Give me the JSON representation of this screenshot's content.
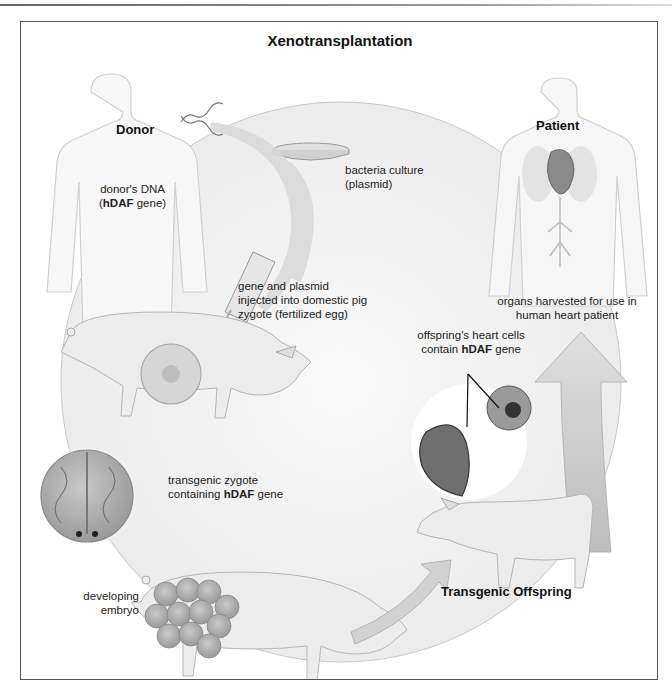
{
  "diagram": {
    "title": "Xenotransplantation",
    "headings": {
      "donor": "Donor",
      "patient": "Patient",
      "offspring": "Transgenic Offspring"
    },
    "labels": {
      "donor_dna": {
        "line1": "donor's DNA",
        "line2_open": "(",
        "line2_bold": "hDAF",
        "line2_rest": " gene)"
      },
      "bacteria": {
        "line1": "bacteria culture",
        "line2": "(plasmid)"
      },
      "injection": {
        "line1": "gene and plasmid",
        "line2": "injected into domestic pig",
        "line3": "zygote (fertilized egg)"
      },
      "zygote": {
        "line1": "transgenic zygote",
        "line2_pre": "containing ",
        "line2_bold": "hDAF",
        "line2_rest": " gene"
      },
      "embryo": {
        "line1": "developing",
        "line2": "embryo"
      },
      "heart_cells": {
        "line1": "offspring's heart cells",
        "line2_pre": "contain ",
        "line2_bold": "hDAF",
        "line2_rest": " gene"
      },
      "organs": {
        "line1": "organs harvested for use in",
        "line2": "human heart patient"
      }
    },
    "colors": {
      "cycle_arrow": "#cfcfcf",
      "pig_skin": "#e4e4e4",
      "cell": "#a9a9a9",
      "heart": "#6f6f6f",
      "frame": "#555555"
    }
  }
}
